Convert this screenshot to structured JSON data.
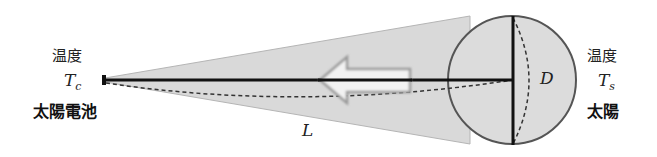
{
  "diagram": {
    "left": {
      "temperature_label": "温度",
      "symbol": "T",
      "symbol_subscript": "c",
      "name": "太陽電池"
    },
    "right": {
      "temperature_label": "温度",
      "symbol": "T",
      "symbol_subscript": "s",
      "name": "太陽"
    },
    "distance_label": "L",
    "diameter_label": "D",
    "colors": {
      "cone_fill": "#d9d9d9",
      "sun_fill": "#dcdcdc",
      "line": "#111111",
      "arrow_fill": "#f2f2f2",
      "arrow_stroke": "#9a9a9a"
    }
  }
}
